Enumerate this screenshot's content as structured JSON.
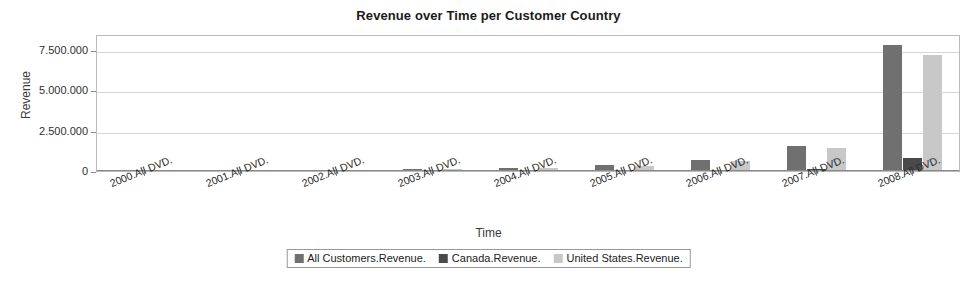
{
  "chart_data": {
    "type": "bar",
    "title": "Revenue over Time per Customer Country",
    "xlabel": "Time",
    "ylabel": "Revenue",
    "grid": true,
    "legend_position": "bottom",
    "ylim": [
      0,
      8500000
    ],
    "yticks": [
      0,
      2500000,
      5000000,
      7500000
    ],
    "ytick_labels": [
      "0",
      "2.500.000",
      "5.000.000",
      "7.500.000"
    ],
    "categories": [
      "2000.All DVD.",
      "2001.All DVD.",
      "2002.All DVD.",
      "2003.All DVD.",
      "2004.All DVD.",
      "2005.All DVD.",
      "2006.All DVD.",
      "2007.All DVD.",
      "2008.All DVD."
    ],
    "series": [
      {
        "name": "All Customers.Revenue.",
        "color": "#707070",
        "values": [
          9000,
          22000,
          90000,
          130000,
          210000,
          370000,
          690000,
          1550000,
          7800000
        ]
      },
      {
        "name": "Canada.Revenue.",
        "color": "#4a4a4a",
        "values": [
          0,
          0,
          0,
          0,
          0,
          0,
          0,
          120000,
          790000
        ]
      },
      {
        "name": "United States.Revenue.",
        "color": "#c8c8c8",
        "values": [
          7000,
          18000,
          75000,
          110000,
          180000,
          330000,
          630000,
          1450000,
          7200000
        ]
      }
    ]
  },
  "legend": {
    "items": [
      {
        "label": "All Customers.Revenue.",
        "color": "#707070"
      },
      {
        "label": "Canada.Revenue.",
        "color": "#4a4a4a"
      },
      {
        "label": "United States.Revenue.",
        "color": "#c8c8c8"
      }
    ]
  }
}
